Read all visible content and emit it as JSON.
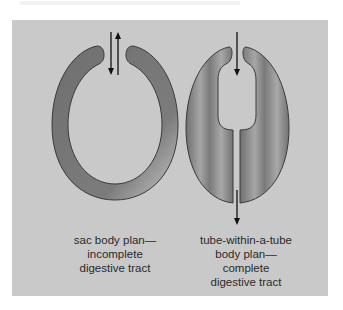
{
  "figure": {
    "colors": {
      "background": "#c9c9c9",
      "body_fill": "#7a7a7a",
      "body_highlight": "#a8a8a8",
      "outline": "#3a3a3a",
      "arrow": "#111111"
    },
    "left_panel": {
      "label_lines": [
        "sac body plan—",
        "incomplete",
        "digestive tract"
      ],
      "arrows": [
        "down-arrow",
        "up-arrow"
      ]
    },
    "right_panel": {
      "label_lines": [
        "tube-within-a-tube",
        "body plan—",
        "complete",
        "digestive tract"
      ],
      "arrows": [
        "down-arrow-mouth",
        "down-arrow-anus"
      ]
    }
  }
}
